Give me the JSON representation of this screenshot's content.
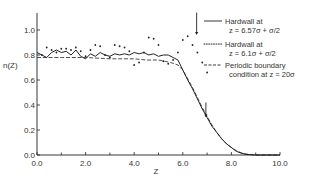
{
  "chart_data": {
    "type": "line",
    "title": "",
    "xlabel": "Z",
    "ylabel": "n(Z)",
    "xlim": [
      0,
      10
    ],
    "ylim": [
      0,
      1.1
    ],
    "grid": false,
    "legend_position": "upper right",
    "x_ticks": [
      0,
      2,
      4,
      6,
      8,
      10
    ],
    "x_tick_labels": [
      "0.0",
      "2.0",
      "4.0",
      "6.0",
      "8.0",
      "10.0"
    ],
    "x_minor_ticks": [
      1,
      3,
      5,
      7,
      9
    ],
    "y_ticks": [
      0,
      0.2,
      0.4,
      0.6,
      0.8,
      1.0
    ],
    "y_tick_labels": [
      "0.0",
      "0.2",
      "0.4",
      "0.6",
      "0.8",
      "1.0"
    ],
    "series": [
      {
        "name": "Hardwall at z = 6.57σ + σ/2",
        "style": "solid",
        "x": [
          0.0,
          0.2,
          0.4,
          0.6,
          0.8,
          1.0,
          1.2,
          1.4,
          1.6,
          1.8,
          2.0,
          2.2,
          2.4,
          2.6,
          2.8,
          3.0,
          3.2,
          3.4,
          3.6,
          3.8,
          4.0,
          4.2,
          4.4,
          4.6,
          4.8,
          5.0,
          5.2,
          5.4,
          5.6,
          5.8,
          6.0,
          6.2,
          6.4,
          6.6,
          6.8,
          7.0,
          7.2,
          7.4,
          7.6,
          7.8,
          8.0,
          8.2,
          8.4,
          8.6,
          9.0,
          10.0
        ],
        "y": [
          0.82,
          0.8,
          0.78,
          0.82,
          0.84,
          0.82,
          0.83,
          0.8,
          0.84,
          0.79,
          0.77,
          0.81,
          0.79,
          0.82,
          0.8,
          0.79,
          0.81,
          0.8,
          0.81,
          0.8,
          0.82,
          0.81,
          0.82,
          0.8,
          0.81,
          0.79,
          0.8,
          0.8,
          0.78,
          0.76,
          0.68,
          0.6,
          0.53,
          0.45,
          0.37,
          0.3,
          0.23,
          0.18,
          0.13,
          0.09,
          0.06,
          0.03,
          0.015,
          0.005,
          0.0,
          0.0
        ]
      },
      {
        "name": "Hardwall at z = 6.1σ + σ/2",
        "style": "dotted",
        "x": [
          0.2,
          0.4,
          0.6,
          0.8,
          1.0,
          1.2,
          1.4,
          1.6,
          1.8,
          2.0,
          2.2,
          2.4,
          2.6,
          2.8,
          3.0,
          3.2,
          3.4,
          3.6,
          3.8,
          4.0,
          4.2,
          4.4,
          4.6,
          4.8,
          5.0,
          5.2,
          5.4,
          5.6,
          5.8,
          6.0,
          6.2,
          6.4,
          6.6,
          6.8,
          7.0
        ],
        "y": [
          0.8,
          0.86,
          0.84,
          0.82,
          0.85,
          0.85,
          0.84,
          0.86,
          0.83,
          0.79,
          0.84,
          0.88,
          0.87,
          0.8,
          0.78,
          0.88,
          0.87,
          0.86,
          0.83,
          0.72,
          0.74,
          0.82,
          0.94,
          0.93,
          0.88,
          0.75,
          0.73,
          0.76,
          0.82,
          0.92,
          0.95,
          0.88,
          0.82,
          0.74,
          0.66
        ]
      },
      {
        "name": "Periodic boundary condition at z = 20σ",
        "style": "dashed",
        "x": [
          0.0,
          1.0,
          2.0,
          3.0,
          4.0,
          4.5,
          5.0,
          5.5,
          5.8,
          6.0,
          6.2,
          6.4,
          6.6,
          6.8,
          7.0,
          7.2,
          7.4,
          7.6,
          7.8,
          8.0,
          8.2,
          8.4,
          8.6,
          9.0,
          10.0
        ],
        "y": [
          0.78,
          0.78,
          0.78,
          0.77,
          0.77,
          0.76,
          0.76,
          0.74,
          0.72,
          0.68,
          0.61,
          0.54,
          0.46,
          0.38,
          0.31,
          0.24,
          0.18,
          0.13,
          0.09,
          0.06,
          0.035,
          0.018,
          0.008,
          0.0,
          0.0
        ]
      }
    ],
    "annotations": [
      {
        "type": "arrow-down",
        "x": 6.57,
        "y_from": 1.14,
        "y_to": 0.96,
        "note": "wall position, hardwall at 6.57σ"
      },
      {
        "type": "arrow-down",
        "x": 6.95,
        "y_from": 0.42,
        "y_to": 0.3,
        "note": "wall position, hardwall at 6.1σ"
      }
    ]
  },
  "legend": {
    "items": [
      {
        "style": "solid",
        "line1": "Hardwall at",
        "line2": "z = 6.57σ + σ/2"
      },
      {
        "style": "dotted",
        "line1": "Hardwall at",
        "line2": "z = 6.1σ + σ/2"
      },
      {
        "style": "dashed",
        "line1": "Periodic boundary",
        "line2": "condition at z = 20σ"
      }
    ]
  },
  "colors": {
    "ink": "#222222",
    "background": "#ffffff"
  }
}
